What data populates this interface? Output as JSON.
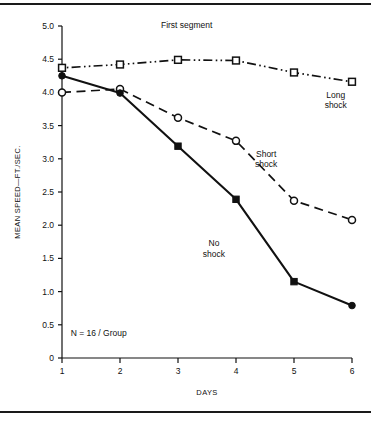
{
  "chart_data": {
    "type": "line",
    "title": "First segment",
    "xlabel": "DAYS",
    "ylabel": "MEAN SPEED—FT./SEC.",
    "x": [
      1,
      2,
      3,
      4,
      5,
      6
    ],
    "xticklabels": [
      "1",
      "2",
      "3",
      "4",
      "5",
      "6"
    ],
    "yticks": [
      0,
      0.5,
      1.0,
      1.5,
      2.0,
      2.5,
      3.0,
      3.5,
      4.0,
      4.5,
      5.0
    ],
    "yticklabels": [
      "0",
      "0.5",
      "1.0",
      "1.5",
      "2.0",
      "2.5",
      "3.0",
      "3.5",
      "4.0",
      "4.5",
      "5.0"
    ],
    "xlim": [
      1,
      6
    ],
    "ylim": [
      0,
      5.0
    ],
    "grid": false,
    "legend_position": "inline-annotations",
    "annotations": [
      {
        "text": "N = 16 / Group",
        "x": 1.15,
        "y": 0.33
      }
    ],
    "series": [
      {
        "name": "Long shock",
        "label": "Long\nshock",
        "label_lines": [
          "Long",
          "shock"
        ],
        "label_x": 5.72,
        "label_y": 3.92,
        "values": [
          4.37,
          4.42,
          4.49,
          4.48,
          4.3,
          4.16
        ],
        "marker": "open-square",
        "linestyle": "dash-dot",
        "color": "#111111"
      },
      {
        "name": "Short shock",
        "label": "Short\nshock",
        "label_lines": [
          "Short",
          "shock"
        ],
        "label_x": 4.52,
        "label_y": 3.03,
        "values": [
          4.0,
          4.05,
          3.62,
          3.27,
          2.37,
          2.08
        ],
        "marker": "open-circle",
        "linestyle": "dashed",
        "color": "#111111"
      },
      {
        "name": "No shock",
        "label": "No\nshock",
        "label_lines": [
          "No",
          "shock"
        ],
        "label_x": 3.62,
        "label_y": 1.68,
        "values": [
          4.25,
          3.99,
          3.19,
          2.39,
          1.15,
          0.79
        ],
        "marker": "filled",
        "linestyle": "solid",
        "color": "#111111"
      }
    ]
  },
  "figure": {
    "title": "First segment",
    "xlabel": "DAYS",
    "ylabel": "MEAN SPEED—FT./SEC.",
    "note": "N = 16 / Group"
  }
}
